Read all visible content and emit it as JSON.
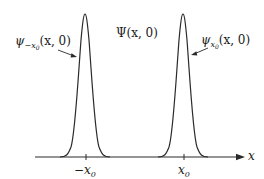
{
  "diagram": {
    "type": "wavefunction-superposition",
    "labels": {
      "total": {
        "symbol": "Ψ",
        "args": "(x, 0)"
      },
      "left_packet": {
        "symbol": "ψ",
        "subscript": "−x",
        "subsub": "0",
        "args": "(x, 0)"
      },
      "right_packet": {
        "symbol": "ψ",
        "subscript": "x",
        "subsub": "0",
        "args": "(x, 0)"
      }
    },
    "axis": {
      "label": "x",
      "ticks": [
        {
          "label_main": "−x",
          "label_sub": "0",
          "position": "-x0"
        },
        {
          "label_main": "x",
          "label_sub": "0",
          "position": "x0"
        }
      ]
    },
    "curves": [
      {
        "name": "left-gaussian",
        "center": "-x0",
        "shape": "gaussian"
      },
      {
        "name": "right-gaussian",
        "center": "x0",
        "shape": "gaussian"
      }
    ],
    "colors": {
      "stroke": "#2a2a2a",
      "background": "#ffffff"
    }
  }
}
